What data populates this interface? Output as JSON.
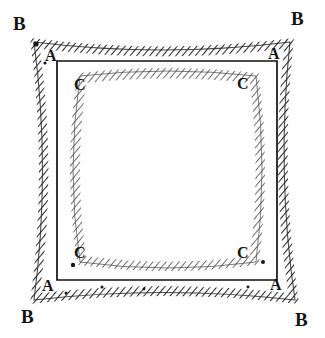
{
  "figure": {
    "background_color": "#ffffff",
    "ink_color": "#1a1a1a",
    "shapes": [
      {
        "id": "square-a",
        "label": "A",
        "style": "solid thin straight lines",
        "stroke": "#111111",
        "stroke_width": 1.6,
        "corners": [
          [
            57,
            61
          ],
          [
            277,
            61
          ],
          [
            277,
            280
          ],
          [
            57,
            280
          ]
        ]
      },
      {
        "id": "pincushion-b",
        "label": "B",
        "style": "hatched band, corners pulled outward, sides bowed inward toward square A",
        "stroke": "#2b2b2b",
        "corners": [
          [
            34,
            42
          ],
          [
            290,
            42
          ],
          [
            295,
            300
          ],
          [
            34,
            300
          ]
        ],
        "side_bow_px": 14
      },
      {
        "id": "barrel-c",
        "label": "C",
        "style": "hatched band, rounded corners pulled inward, sides bowed outward",
        "stroke": "#3a3a3a",
        "corners": [
          [
            72,
            76
          ],
          [
            262,
            76
          ],
          [
            262,
            266
          ],
          [
            72,
            266
          ]
        ],
        "side_bow_px": 9
      }
    ],
    "labels": [
      {
        "text": "B",
        "x": 13,
        "y": 14,
        "corner": "top-left",
        "shape": "pincushion-b"
      },
      {
        "text": "B",
        "x": 291,
        "y": 9,
        "corner": "top-right",
        "shape": "pincushion-b"
      },
      {
        "text": "B",
        "x": 21,
        "y": 307,
        "corner": "bottom-left",
        "shape": "pincushion-b"
      },
      {
        "text": "B",
        "x": 295,
        "y": 310,
        "corner": "bottom-right",
        "shape": "pincushion-b"
      },
      {
        "text": "A",
        "x": 45,
        "y": 48,
        "corner": "top-left",
        "shape": "square-a"
      },
      {
        "text": "A",
        "x": 268,
        "y": 46,
        "corner": "top-right",
        "shape": "square-a"
      },
      {
        "text": "A",
        "x": 42,
        "y": 278,
        "corner": "bottom-left",
        "shape": "square-a"
      },
      {
        "text": "A",
        "x": 270,
        "y": 277,
        "corner": "bottom-right",
        "shape": "square-a"
      },
      {
        "text": "C",
        "x": 74,
        "y": 77,
        "corner": "top-left",
        "shape": "barrel-c"
      },
      {
        "text": "C",
        "x": 237,
        "y": 76,
        "corner": "top-right",
        "shape": "barrel-c"
      },
      {
        "text": "C",
        "x": 74,
        "y": 245,
        "corner": "bottom-left",
        "shape": "barrel-c"
      },
      {
        "text": "C",
        "x": 237,
        "y": 245,
        "corner": "bottom-right",
        "shape": "barrel-c"
      }
    ]
  }
}
